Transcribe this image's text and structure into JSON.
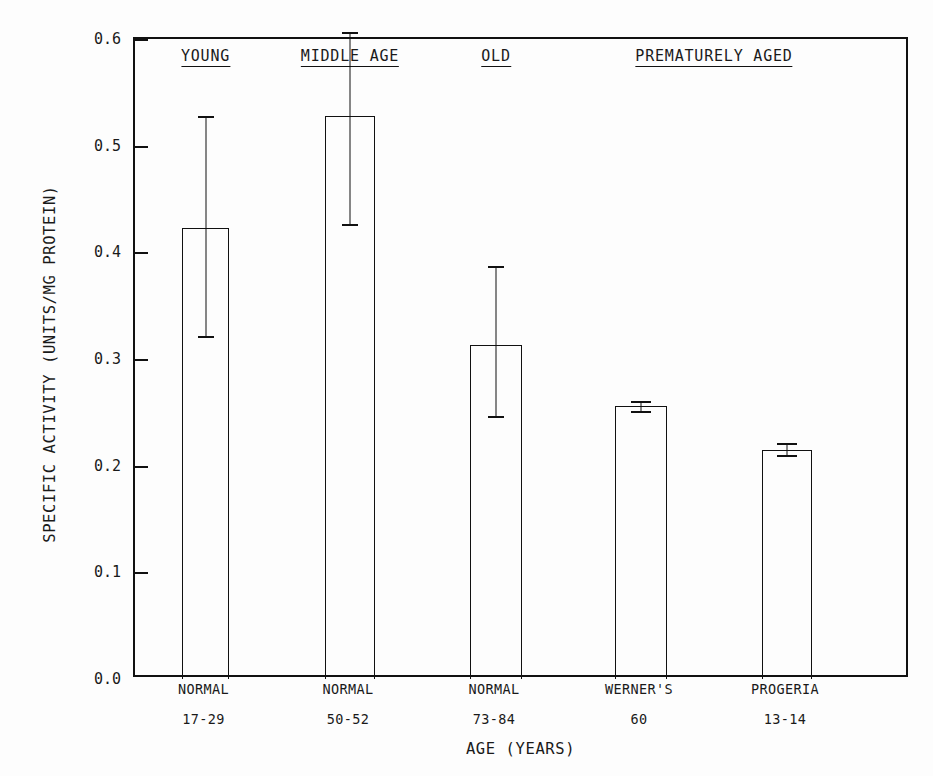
{
  "chart_data": {
    "type": "bar",
    "title": "",
    "xlabel": "AGE (YEARS)",
    "ylabel": "SPECIFIC ACTIVITY (UNITS/MG PROTEIN)",
    "ylim": [
      0.0,
      0.6
    ],
    "ytick_labels": [
      "0.0",
      "0.1",
      "0.2",
      "0.3",
      "0.4",
      "0.5",
      "0.6"
    ],
    "ytick_values": [
      0.0,
      0.1,
      0.2,
      0.3,
      0.4,
      0.5,
      0.6
    ],
    "grid": false,
    "legend": "none",
    "group_headers": [
      {
        "label": "YOUNG",
        "center_bar_index": 0
      },
      {
        "label": "MIDDLE AGE",
        "center_bar_index": 1
      },
      {
        "label": "OLD",
        "center_bar_index": 2
      },
      {
        "label": "PREMATURELY AGED",
        "center_between": [
          3,
          4
        ]
      }
    ],
    "categories": [
      "NORMAL",
      "NORMAL",
      "NORMAL",
      "WERNER'S",
      "PROGERIA"
    ],
    "category_ranges": [
      "17-29",
      "50-52",
      "73-84",
      "60",
      "13-14"
    ],
    "values": [
      0.423,
      0.528,
      0.313,
      0.256,
      0.215
    ],
    "error_upper": [
      0.528,
      0.607,
      0.387,
      0.261,
      0.221
    ],
    "error_lower": [
      0.322,
      0.427,
      0.247,
      0.251,
      0.21
    ],
    "bars": [
      {
        "group": "YOUNG",
        "category": "NORMAL",
        "age_range": "17-29",
        "value": 0.423,
        "err_high": 0.528,
        "err_low": 0.322
      },
      {
        "group": "MIDDLE AGE",
        "category": "NORMAL",
        "age_range": "50-52",
        "value": 0.528,
        "err_high": 0.607,
        "err_low": 0.427
      },
      {
        "group": "OLD",
        "category": "NORMAL",
        "age_range": "73-84",
        "value": 0.313,
        "err_high": 0.387,
        "err_low": 0.247
      },
      {
        "group": "PREMATURELY AGED",
        "category": "WERNER'S",
        "age_range": "60",
        "value": 0.256,
        "err_high": 0.261,
        "err_low": 0.251
      },
      {
        "group": "PREMATURELY AGED",
        "category": "PROGERIA",
        "age_range": "13-14",
        "value": 0.215,
        "err_high": 0.221,
        "err_low": 0.21
      }
    ],
    "colors": {
      "background": "#fdfdfd",
      "axis": "#111111",
      "bar_fill": "none",
      "bar_edge": "#111111",
      "text": "#1a1a1a"
    }
  }
}
